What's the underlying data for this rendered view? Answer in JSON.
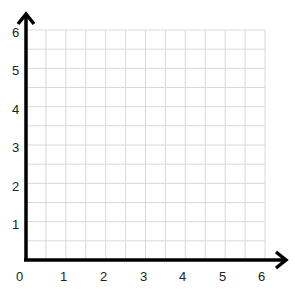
{
  "chart_data": {
    "type": "grid",
    "title": "",
    "xlabel": "",
    "ylabel": "",
    "xlim": [
      0,
      6
    ],
    "ylim": [
      0,
      6
    ],
    "grid": true,
    "grid_minor_step": 0.5,
    "x_ticks": [
      "0",
      "1",
      "2",
      "3",
      "4",
      "5",
      "6"
    ],
    "y_ticks": [
      "1",
      "2",
      "3",
      "4",
      "5",
      "6"
    ],
    "series": []
  },
  "colors": {
    "axis": "#000000",
    "grid": "#d9d9d9",
    "text": "#222222"
  }
}
